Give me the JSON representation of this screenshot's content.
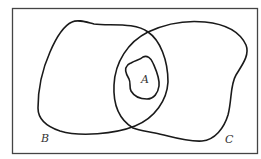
{
  "diagram": {
    "type": "venn",
    "universe": {
      "shape": "rectangle",
      "border_color": "#444444"
    },
    "sets": [
      {
        "id": "A",
        "label": "A",
        "position": "inside intersection of B and C"
      },
      {
        "id": "B",
        "label": "B",
        "position": "left region"
      },
      {
        "id": "C",
        "label": "C",
        "position": "right region"
      }
    ],
    "relationships": [
      "A ⊂ B",
      "A ⊂ C",
      "A ⊂ B ∩ C"
    ],
    "stroke_color": "#1a1a1a",
    "label_color": "#333333"
  }
}
